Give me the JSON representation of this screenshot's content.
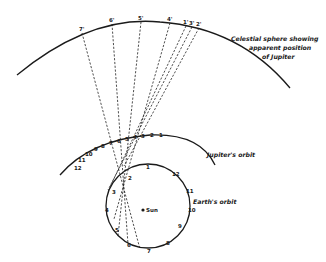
{
  "diagram": {
    "type": "astronomy-retrograde-motion",
    "labels": {
      "celestial_sphere": [
        "Celestial sphere showing",
        "apparent position",
        "of Jupiter"
      ],
      "jupiter_orbit": "Jupiter's orbit",
      "earth_orbit": "Earth's orbit",
      "sun": "Sun"
    },
    "celestial_points": [
      "7'",
      "6'",
      "5'",
      "4'",
      "1'",
      "3'",
      "2'"
    ],
    "jupiter_positions": [
      "1",
      "2",
      "3",
      "4",
      "5",
      "6",
      "7",
      "8",
      "9",
      "10",
      "11",
      "12"
    ],
    "earth_positions": [
      "1",
      "2",
      "3",
      "4",
      "5",
      "6",
      "7",
      "8",
      "9",
      "10",
      "11",
      "12"
    ],
    "colors": {
      "ink": "#1a1a1a",
      "background": "#ffffff"
    }
  }
}
